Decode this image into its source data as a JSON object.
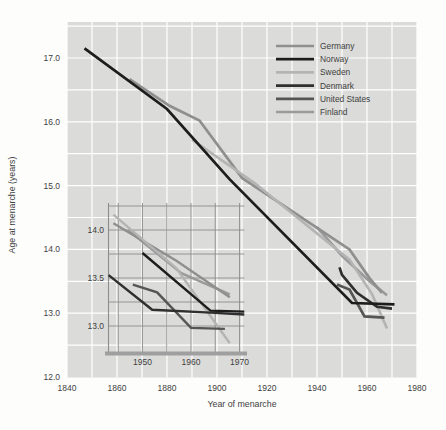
{
  "figure": {
    "x_axis_title": "Year of menarche",
    "y_axis_title": "Age at menarche (years)",
    "legend": [
      {
        "label": "Germany",
        "color": "#8f8f8f"
      },
      {
        "label": "Norway",
        "color": "#1d1d1d"
      },
      {
        "label": "Sweden",
        "color": "#b4b4b4"
      },
      {
        "label": "Denmark",
        "color": "#2f2f2f"
      },
      {
        "label": "United States",
        "color": "#555555"
      },
      {
        "label": "Finland",
        "color": "#9a9a9a"
      }
    ],
    "colors": {
      "plot_bg": "#dbdbd9",
      "grid_main": "#ffffff",
      "grid_inset": "#8d8d8d",
      "inset_axis": "#9f9f9f",
      "text": "#3f3f3f"
    }
  },
  "chart_data": [
    {
      "id": "main",
      "type": "line",
      "title": "",
      "xlabel": "Year of menarche",
      "ylabel": "Age at menarche (years)",
      "xlim": [
        1840,
        1980
      ],
      "ylim": [
        12.0,
        17.6
      ],
      "x_ticks": [
        "1840",
        "1860",
        "1880",
        "1900",
        "1920",
        "1940",
        "1960",
        "1980"
      ],
      "y_ticks": [
        "17.0",
        "16.0",
        "15.0",
        "14.0",
        "13.0",
        "12.0"
      ],
      "grid": {
        "x_step_years": 10,
        "y_step_age": 0.5,
        "style": "white gridlines on gray panel"
      },
      "legend_position": "top-right",
      "series": [
        {
          "name": "Germany",
          "color": "#8f8f8f",
          "points": [
            [
              1865,
              16.67
            ],
            [
              1881,
              16.25
            ],
            [
              1893,
              16.02
            ],
            [
              1910,
              15.12
            ],
            [
              1953,
              14.0
            ],
            [
              1961,
              13.55
            ],
            [
              1966,
              13.32
            ]
          ]
        },
        {
          "name": "Norway",
          "color": "#1d1d1d",
          "points": [
            [
              1847,
              17.15
            ],
            [
              1880,
              16.2
            ],
            [
              1905,
              15.1
            ],
            [
              1954,
              13.16
            ],
            [
              1971,
              13.14
            ]
          ]
        },
        {
          "name": "Sweden",
          "color": "#b4b4b4",
          "points": [
            [
              1890,
              15.72
            ],
            [
              1915,
              15.04
            ],
            [
              1953,
              13.84
            ],
            [
              1962,
              13.3
            ],
            [
              1968,
              12.76
            ]
          ]
        },
        {
          "name": "Denmark",
          "color": "#2f2f2f",
          "points": [
            [
              1949,
              13.72
            ],
            [
              1950,
              13.6
            ],
            [
              1956,
              13.32
            ],
            [
              1964,
              13.1
            ],
            [
              1970,
              13.07
            ]
          ]
        },
        {
          "name": "United States",
          "color": "#555555",
          "points": [
            [
              1948,
              13.45
            ],
            [
              1953,
              13.37
            ],
            [
              1959,
              12.95
            ],
            [
              1967,
              12.93
            ]
          ]
        },
        {
          "name": "Finland",
          "color": "#9a9a9a",
          "points": [
            [
              1940,
              14.35
            ],
            [
              1950,
              13.9
            ],
            [
              1961,
              13.5
            ],
            [
              1968,
              13.28
            ]
          ]
        }
      ]
    },
    {
      "id": "inset",
      "type": "line",
      "title": "",
      "xlabel": "",
      "ylabel": "",
      "xlim": [
        1943,
        1971.5
      ],
      "ylim": [
        12.72,
        14.3
      ],
      "x_ticks": [
        "1950",
        "1960",
        "1970"
      ],
      "y_ticks": [
        "14.0",
        "13.5",
        "13.0"
      ],
      "grid": {
        "x_step_years": 5,
        "y_step_age": 0.25,
        "style": "thin dark gridlines, thick gray bottom axis"
      },
      "legend_position": "none",
      "series": [
        {
          "name": "Germany",
          "color": "#8f8f8f",
          "points": [
            [
              1944,
              14.07
            ],
            [
              1957,
              13.68
            ],
            [
              1968,
              13.3
            ]
          ]
        },
        {
          "name": "Norway",
          "color": "#1d1d1d",
          "points": [
            [
              1950,
              13.76
            ],
            [
              1964,
              13.16
            ],
            [
              1971,
              13.15
            ]
          ]
        },
        {
          "name": "Sweden",
          "color": "#b4b4b4",
          "points": [
            [
              1944,
              14.16
            ],
            [
              1957,
              13.6
            ],
            [
              1968,
              12.82
            ]
          ]
        },
        {
          "name": "Denmark",
          "color": "#2f2f2f",
          "points": [
            [
              1943,
              13.53
            ],
            [
              1952,
              13.17
            ],
            [
              1964,
              13.14
            ],
            [
              1971,
              13.12
            ]
          ]
        },
        {
          "name": "United States",
          "color": "#555555",
          "points": [
            [
              1948,
              13.43
            ],
            [
              1953,
              13.35
            ],
            [
              1960,
              12.98
            ],
            [
              1967,
              12.97
            ]
          ]
        },
        {
          "name": "Finland",
          "color": "#9a9a9a",
          "points": [
            [
              1947,
              14.0
            ],
            [
              1958,
              13.55
            ],
            [
              1968,
              13.33
            ]
          ]
        }
      ]
    }
  ]
}
